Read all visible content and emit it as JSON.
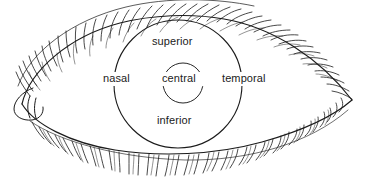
{
  "figure": {
    "background_color": "#ffffff",
    "line_color": "#1b1b1b",
    "width": 372,
    "height": 183
  },
  "labels": {
    "superior": "superior",
    "nasal": "nasal",
    "central": "central",
    "temporal": "temporal",
    "inferior": "inferior"
  },
  "anatomy": {
    "eye_outline": "almond-shaped palpebral fissure",
    "caruncle": "medial canthus caruncle",
    "upper_lashes": "upper eyelash row",
    "lower_lashes": "lower eyelash row",
    "outer_ring": "limbus / peripheral corneal zone ring",
    "inner_ring": "central corneal zone ring"
  },
  "geometry": {
    "outer_ring": {
      "cx": 178,
      "cy": 84,
      "r": 64
    },
    "inner_ring": {
      "cx": 183,
      "cy": 83,
      "r": 20
    },
    "left_canthus": {
      "x": 14,
      "y": 103
    },
    "right_canthus": {
      "x": 352,
      "y": 100
    }
  }
}
